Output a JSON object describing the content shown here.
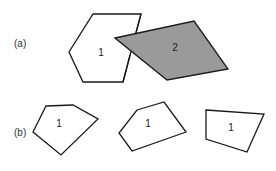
{
  "figure": {
    "panels": [
      {
        "id": "a",
        "label": "(a)",
        "label_pos": [
          14,
          47
        ],
        "polygons": [
          {
            "name": "hexagon",
            "label": "1",
            "fill": "#ffffff",
            "points": "93,14 141,14 123,82 83,82 69,52",
            "label_pos": [
              101,
              56
            ]
          },
          {
            "name": "parallelogram",
            "label": "2",
            "fill": "#9a9a9a",
            "points": "115,38 194,21 228,69 167,80",
            "label_pos": [
              175,
              51
            ]
          }
        ]
      },
      {
        "id": "b",
        "label": "(b)",
        "label_pos": [
          14,
          136
        ],
        "polygons": [
          {
            "name": "pentagon-left",
            "label": "1",
            "fill": "#ffffff",
            "points": "46,106 73,105 98,119 61,155 33,132",
            "label_pos": [
              59,
              127
            ]
          },
          {
            "name": "pentagon-middle",
            "label": "1",
            "fill": "#ffffff",
            "points": "137,110 164,102 186,132 132,151 119,133",
            "label_pos": [
              148,
              127
            ]
          },
          {
            "name": "quadrilateral-right",
            "label": "1",
            "fill": "#ffffff",
            "points": "206,110 264,114 247,152 206,139",
            "label_pos": [
              231,
              131
            ]
          }
        ]
      }
    ],
    "colors": {
      "stroke": "#1a1a1a",
      "gray_fill": "#9a9a9a",
      "background": "#ffffff"
    }
  }
}
